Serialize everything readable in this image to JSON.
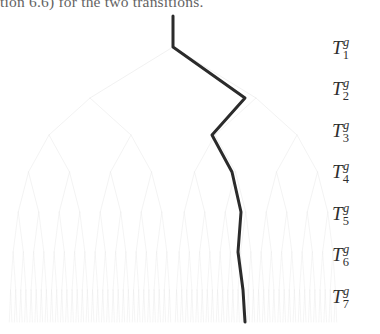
{
  "document": {
    "running_text": "tion 6.6) for the two transitions."
  },
  "figure": {
    "type": "binary-tree-diagram",
    "tree": {
      "depth": 7,
      "branch_color": "#e8e8e8",
      "branch_width": 0.6,
      "root": {
        "x": 173,
        "y": 16
      },
      "apex": {
        "x": 173,
        "y": 47
      },
      "level_y": [
        47,
        98,
        135,
        172,
        212,
        252,
        290,
        322
      ],
      "level_half_span": [
        83,
        41,
        20.5,
        10.25,
        5.1,
        2.55,
        1.3
      ],
      "x_min": 5,
      "x_max": 311
    },
    "path": {
      "color": "#2b2b2b",
      "width": 3.0,
      "label": "highlighted-transition-path",
      "points": [
        {
          "x": 173,
          "y": 16
        },
        {
          "x": 173,
          "y": 47
        },
        {
          "x": 245,
          "y": 98
        },
        {
          "x": 212,
          "y": 135
        },
        {
          "x": 232,
          "y": 172
        },
        {
          "x": 241,
          "y": 212
        },
        {
          "x": 238,
          "y": 252
        },
        {
          "x": 243,
          "y": 290
        },
        {
          "x": 245,
          "y": 322
        }
      ]
    },
    "level_labels": [
      {
        "base": "T",
        "sup": "g",
        "sub": "1",
        "y": 36
      },
      {
        "base": "T",
        "sup": "g",
        "sub": "2",
        "y": 77
      },
      {
        "base": "T",
        "sup": "g",
        "sub": "3",
        "y": 119
      },
      {
        "base": "T",
        "sup": "g",
        "sub": "4",
        "y": 160
      },
      {
        "base": "T",
        "sup": "g",
        "sub": "5",
        "y": 202
      },
      {
        "base": "T",
        "sup": "g",
        "sub": "6",
        "y": 243
      },
      {
        "base": "T",
        "sup": "g",
        "sub": "7",
        "y": 285
      }
    ]
  }
}
